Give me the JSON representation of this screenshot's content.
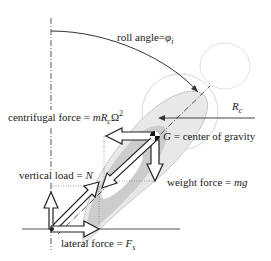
{
  "diagram": {
    "labels": {
      "roll_angle": {
        "prefix": "roll angle=",
        "symbol": "φ",
        "subscript": "i"
      },
      "radius": {
        "symbol": "R",
        "subscript": "c"
      },
      "centrifugal_force": {
        "prefix": "centrifugal force = ",
        "symbol": "mR",
        "subscript": "c",
        "suffix": "Ω",
        "superscript": "2"
      },
      "center_of_gravity": {
        "symbol": "G",
        "suffix": " = center of gravity"
      },
      "vertical_load": {
        "prefix": "vertical load = ",
        "symbol": "N"
      },
      "weight_force": {
        "prefix": "weight force = ",
        "symbol": "mg"
      },
      "lateral_force": {
        "prefix": "lateral force = ",
        "symbol": "F",
        "subscript": "s"
      }
    },
    "colors": {
      "line": "#222222",
      "shape_light": "#e6e6e6",
      "shape_mid": "#cfcfcf",
      "outline_faint": "#dddddd",
      "arrow_fill": "#ffffff"
    }
  }
}
